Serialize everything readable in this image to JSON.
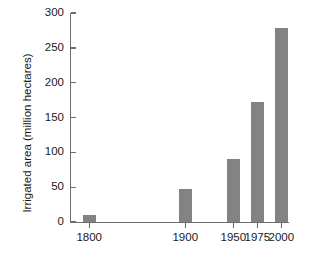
{
  "chart_data": {
    "type": "bar",
    "title": "",
    "xlabel": "",
    "ylabel": "Irrigated area (million hectares)",
    "categories": [
      "1800",
      "1900",
      "1950",
      "1975",
      "2000"
    ],
    "values": [
      10,
      47,
      90,
      172,
      279
    ],
    "series": [
      {
        "name": "Irrigated area",
        "values": [
          10,
          47,
          90,
          172,
          279
        ]
      }
    ],
    "ylim": [
      0,
      300
    ],
    "y_ticks": [
      0,
      50,
      100,
      150,
      200,
      250,
      300
    ],
    "y_tick_labels": [
      "0",
      "50",
      "100",
      "150",
      "200",
      "250",
      "300"
    ],
    "x_tick_labels": [
      "1800",
      "1900",
      "1950",
      "1975",
      "2000"
    ],
    "x_positions": [
      1800,
      1900,
      1950,
      1975,
      2000
    ],
    "xlim": [
      1780,
      2008
    ],
    "grid": false,
    "legend": null,
    "bar_color": "#838383",
    "axis_color": "#6e6e6e",
    "text_color": "#1a1a1a",
    "background": "#ffffff"
  }
}
